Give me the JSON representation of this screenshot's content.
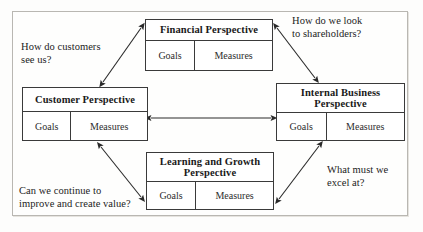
{
  "diagram": {
    "frame": {
      "border_color": "#b9b7b2",
      "background": "#fefefd"
    },
    "line_color": "#3a3a3a",
    "cell_labels": {
      "goals": "Goals",
      "measures": "Measures"
    },
    "boxes": [
      {
        "id": "financial",
        "title": "Financial Perspective",
        "goals": "Goals",
        "measures": "Measures"
      },
      {
        "id": "customer",
        "title": "Customer Perspective",
        "goals": "Goals",
        "measures": "Measures"
      },
      {
        "id": "internal",
        "title": "Internal Business\nPerspective",
        "goals": "Goals",
        "measures": "Measures"
      },
      {
        "id": "learning",
        "title": "Learning and Growth\nPerspective",
        "goals": "Goals",
        "measures": "Measures"
      }
    ],
    "captions": [
      {
        "id": "customer-question",
        "text": "How do customers\nsee us?"
      },
      {
        "id": "financial-question",
        "text": "How do we look\nto shareholders?"
      },
      {
        "id": "learning-question",
        "text": "Can we continue to\nimprove and create value?"
      },
      {
        "id": "internal-question",
        "text": "What must we\nexcel at?"
      }
    ],
    "connectors": [
      {
        "id": "customer-financial",
        "from": "customer",
        "to": "financial",
        "style": "double-headed-diagonal"
      },
      {
        "id": "financial-internal",
        "from": "financial",
        "to": "internal",
        "style": "double-headed-diagonal"
      },
      {
        "id": "customer-internal",
        "from": "customer",
        "to": "internal",
        "style": "double-headed-horizontal"
      },
      {
        "id": "customer-learning",
        "from": "customer",
        "to": "learning",
        "style": "double-headed-diagonal"
      },
      {
        "id": "learning-internal",
        "from": "learning",
        "to": "internal",
        "style": "double-headed-diagonal"
      }
    ]
  }
}
